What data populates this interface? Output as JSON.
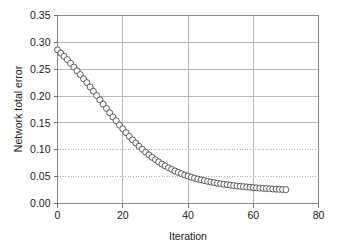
{
  "chart_data": {
    "type": "line",
    "title": "",
    "subtitle": "",
    "xlabel": "Iteration",
    "ylabel": "Network total error",
    "xlim": [
      0,
      80
    ],
    "ylim": [
      0.0,
      0.35
    ],
    "xticks": [
      0,
      20,
      40,
      60,
      80
    ],
    "yticks": [
      0.0,
      0.05,
      0.1,
      0.15,
      0.2,
      0.25,
      0.3,
      0.35
    ],
    "xtick_labels": [
      "0",
      "20",
      "40",
      "60",
      "80"
    ],
    "ytick_labels": [
      "0.00",
      "0.05",
      "0.10",
      "0.15",
      "0.20",
      "0.25",
      "0.30",
      "0.35"
    ],
    "grid": {
      "horizontal": true,
      "vertical": true,
      "dotted_y_levels": [
        0.05,
        0.1
      ],
      "color": "#b8b8b8"
    },
    "legend": {
      "visible": false,
      "position": "none"
    },
    "marker": {
      "shape": "open-circle",
      "size": 3.0,
      "fill": "#ffffff",
      "edge": "#4a4a4a"
    },
    "line_color": "#5a5a5a",
    "background": "#ffffff",
    "series": [
      {
        "name": "Network total error",
        "x": [
          0,
          1,
          2,
          3,
          4,
          5,
          6,
          7,
          8,
          9,
          10,
          11,
          12,
          13,
          14,
          15,
          16,
          17,
          18,
          19,
          20,
          21,
          22,
          23,
          24,
          25,
          26,
          27,
          28,
          29,
          30,
          31,
          32,
          33,
          34,
          35,
          36,
          37,
          38,
          39,
          40,
          41,
          42,
          43,
          44,
          45,
          46,
          47,
          48,
          49,
          50,
          51,
          52,
          53,
          54,
          55,
          56,
          57,
          58,
          59,
          60,
          61,
          62,
          63,
          64,
          65,
          66,
          67,
          68,
          69,
          70
        ],
        "values": [
          0.286,
          0.28,
          0.274,
          0.268,
          0.261,
          0.254,
          0.247,
          0.24,
          0.232,
          0.225,
          0.217,
          0.209,
          0.201,
          0.193,
          0.185,
          0.177,
          0.169,
          0.161,
          0.154,
          0.146,
          0.139,
          0.132,
          0.125,
          0.1185,
          0.1125,
          0.1065,
          0.101,
          0.0955,
          0.0905,
          0.086,
          0.0815,
          0.0775,
          0.0735,
          0.07,
          0.0665,
          0.0635,
          0.0605,
          0.058,
          0.0555,
          0.053,
          0.051,
          0.049,
          0.0472,
          0.0455,
          0.044,
          0.0426,
          0.0413,
          0.04,
          0.0389,
          0.0378,
          0.0368,
          0.0359,
          0.035,
          0.0342,
          0.0334,
          0.0327,
          0.032,
          0.0314,
          0.0308,
          0.0302,
          0.0297,
          0.0292,
          0.0287,
          0.0283,
          0.0279,
          0.0275,
          0.0271,
          0.0267,
          0.0264,
          0.0261,
          0.0258
        ]
      }
    ]
  }
}
